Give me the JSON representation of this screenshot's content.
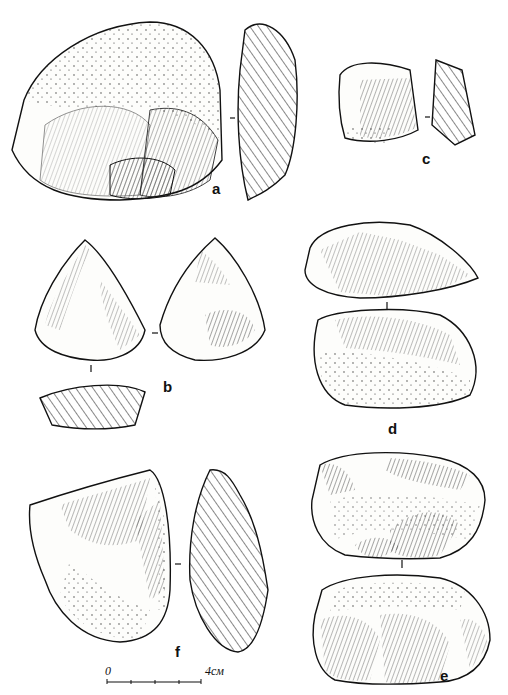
{
  "figure": {
    "labels": {
      "a": "a",
      "b": "b",
      "c": "c",
      "d": "d",
      "e": "e",
      "f": "f"
    },
    "scale_bar": {
      "start": "0",
      "end": "4см"
    },
    "colors": {
      "ink": "#111111",
      "paper": "#ffffff"
    }
  }
}
